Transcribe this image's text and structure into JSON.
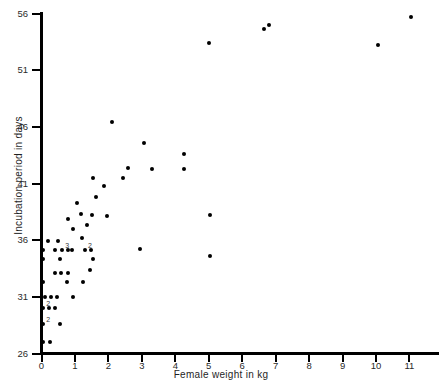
{
  "figure": {
    "clipped_header": "",
    "background": "#ffffff",
    "point_color": "#000000",
    "axis_color": "#000000"
  },
  "chart_data": {
    "type": "scatter",
    "title": "",
    "xlabel": "Female weight in kg",
    "ylabel": "Incubation period in days",
    "xlim": [
      0,
      11.9
    ],
    "ylim": [
      26,
      56
    ],
    "xticks": [
      0,
      1,
      2,
      3,
      4,
      5,
      6,
      7,
      8,
      9,
      10,
      11
    ],
    "xticklabels": [
      "0",
      "1",
      "2",
      "3",
      "4",
      "5",
      "6",
      "7",
      "8",
      "9",
      "10",
      "11"
    ],
    "yticks": [
      26,
      31,
      36,
      41,
      46,
      51,
      56
    ],
    "yticklabels": [
      "26",
      "31",
      "36",
      "41",
      "46",
      "51",
      "56"
    ],
    "grid": false,
    "legend": null,
    "marker": "filled-circle",
    "points": [
      {
        "x": 0.05,
        "y": 27.0
      },
      {
        "x": 0.25,
        "y": 27.0
      },
      {
        "x": 0.05,
        "y": 28.6,
        "n": 2
      },
      {
        "x": 0.55,
        "y": 28.6
      },
      {
        "x": 0.05,
        "y": 30.0,
        "n": 2
      },
      {
        "x": 0.22,
        "y": 30.0
      },
      {
        "x": 0.4,
        "y": 30.0
      },
      {
        "x": 0.1,
        "y": 31.0
      },
      {
        "x": 0.28,
        "y": 31.0
      },
      {
        "x": 0.45,
        "y": 31.0
      },
      {
        "x": 0.95,
        "y": 31.0
      },
      {
        "x": 0.05,
        "y": 32.3
      },
      {
        "x": 0.75,
        "y": 32.3
      },
      {
        "x": 1.25,
        "y": 32.3
      },
      {
        "x": 0.4,
        "y": 33.1
      },
      {
        "x": 0.58,
        "y": 33.1
      },
      {
        "x": 0.8,
        "y": 33.1
      },
      {
        "x": 1.45,
        "y": 33.4
      },
      {
        "x": 0.05,
        "y": 34.3
      },
      {
        "x": 0.55,
        "y": 34.3
      },
      {
        "x": 1.55,
        "y": 34.3
      },
      {
        "x": 0.05,
        "y": 35.1
      },
      {
        "x": 0.4,
        "y": 35.1
      },
      {
        "x": 0.62,
        "y": 35.1,
        "n": 3
      },
      {
        "x": 0.78,
        "y": 35.1
      },
      {
        "x": 0.92,
        "y": 35.1
      },
      {
        "x": 1.3,
        "y": 35.1,
        "n": 2
      },
      {
        "x": 1.48,
        "y": 35.1
      },
      {
        "x": 0.18,
        "y": 35.9
      },
      {
        "x": 0.5,
        "y": 35.9
      },
      {
        "x": 1.22,
        "y": 36.2
      },
      {
        "x": 2.95,
        "y": 35.2
      },
      {
        "x": 5.05,
        "y": 34.6
      },
      {
        "x": 0.95,
        "y": 37.0
      },
      {
        "x": 1.35,
        "y": 37.3
      },
      {
        "x": 0.78,
        "y": 37.9
      },
      {
        "x": 1.18,
        "y": 38.3
      },
      {
        "x": 1.52,
        "y": 38.2
      },
      {
        "x": 1.95,
        "y": 38.1
      },
      {
        "x": 5.05,
        "y": 38.2
      },
      {
        "x": 1.05,
        "y": 39.3
      },
      {
        "x": 1.62,
        "y": 39.8
      },
      {
        "x": 1.88,
        "y": 40.8
      },
      {
        "x": 1.55,
        "y": 41.5
      },
      {
        "x": 2.45,
        "y": 41.5
      },
      {
        "x": 2.6,
        "y": 42.4
      },
      {
        "x": 3.3,
        "y": 42.3
      },
      {
        "x": 4.25,
        "y": 42.3
      },
      {
        "x": 3.05,
        "y": 44.6
      },
      {
        "x": 4.25,
        "y": 43.6
      },
      {
        "x": 2.1,
        "y": 46.4
      },
      {
        "x": 5.0,
        "y": 53.4
      },
      {
        "x": 6.65,
        "y": 54.6
      },
      {
        "x": 6.8,
        "y": 55.0
      },
      {
        "x": 10.05,
        "y": 53.2
      },
      {
        "x": 11.05,
        "y": 55.7
      }
    ]
  }
}
